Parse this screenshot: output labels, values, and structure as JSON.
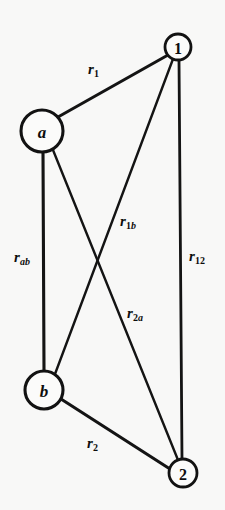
{
  "figure": {
    "background_color": "#f8f8f7",
    "ink_color": "#121212",
    "caption": ""
  },
  "diagram": {
    "type": "graph",
    "nodes": [
      {
        "id": "a",
        "label": "a",
        "style": "italic",
        "cx": 42,
        "cy": 131,
        "r": 21
      },
      {
        "id": "b",
        "label": "b",
        "style": "italic",
        "cx": 44,
        "cy": 390,
        "r": 19
      },
      {
        "id": "1",
        "label": "1",
        "style": "numeric",
        "cx": 178,
        "cy": 47,
        "r": 13
      },
      {
        "id": "2",
        "label": "2",
        "style": "numeric",
        "cx": 183,
        "cy": 473,
        "r": 14
      }
    ],
    "edges": [
      {
        "id": "r1",
        "from": "a",
        "to": "1",
        "label_base": "r",
        "label_sub": "1",
        "sub_style": "upright",
        "label_x": 88,
        "label_y": 62
      },
      {
        "id": "rab",
        "from": "a",
        "to": "b",
        "label_base": "r",
        "label_sub": "ab",
        "sub_style": "italic",
        "label_x": 14,
        "label_y": 250
      },
      {
        "id": "r1b",
        "from": "1",
        "to": "b",
        "label_base": "r",
        "label_sub": "1b",
        "sub_style": "mixed",
        "label_x": 120,
        "label_y": 214
      },
      {
        "id": "r2a",
        "from": "2",
        "to": "a",
        "label_base": "r",
        "label_sub": "2a",
        "sub_style": "mixed",
        "label_x": 127,
        "label_y": 306
      },
      {
        "id": "r12",
        "from": "1",
        "to": "2",
        "label_base": "r",
        "label_sub": "12",
        "sub_style": "upright",
        "label_x": 189,
        "label_y": 249
      },
      {
        "id": "r2",
        "from": "b",
        "to": "2",
        "label_base": "r",
        "label_sub": "2",
        "sub_style": "upright",
        "label_x": 87,
        "label_y": 436
      }
    ]
  },
  "labels": {
    "node_a": "a",
    "node_b": "b",
    "node_1": "1",
    "node_2": "2",
    "r1_base": "r",
    "r1_sub": "1",
    "rab_base": "r",
    "rab_sub": "ab",
    "r1b_base": "r",
    "r1b_sub_num": "1",
    "r1b_sub_alpha": "b",
    "r2a_base": "r",
    "r2a_sub_num": "2",
    "r2a_sub_alpha": "a",
    "r12_base": "r",
    "r12_sub": "12",
    "r2_base": "r",
    "r2_sub": "2"
  }
}
